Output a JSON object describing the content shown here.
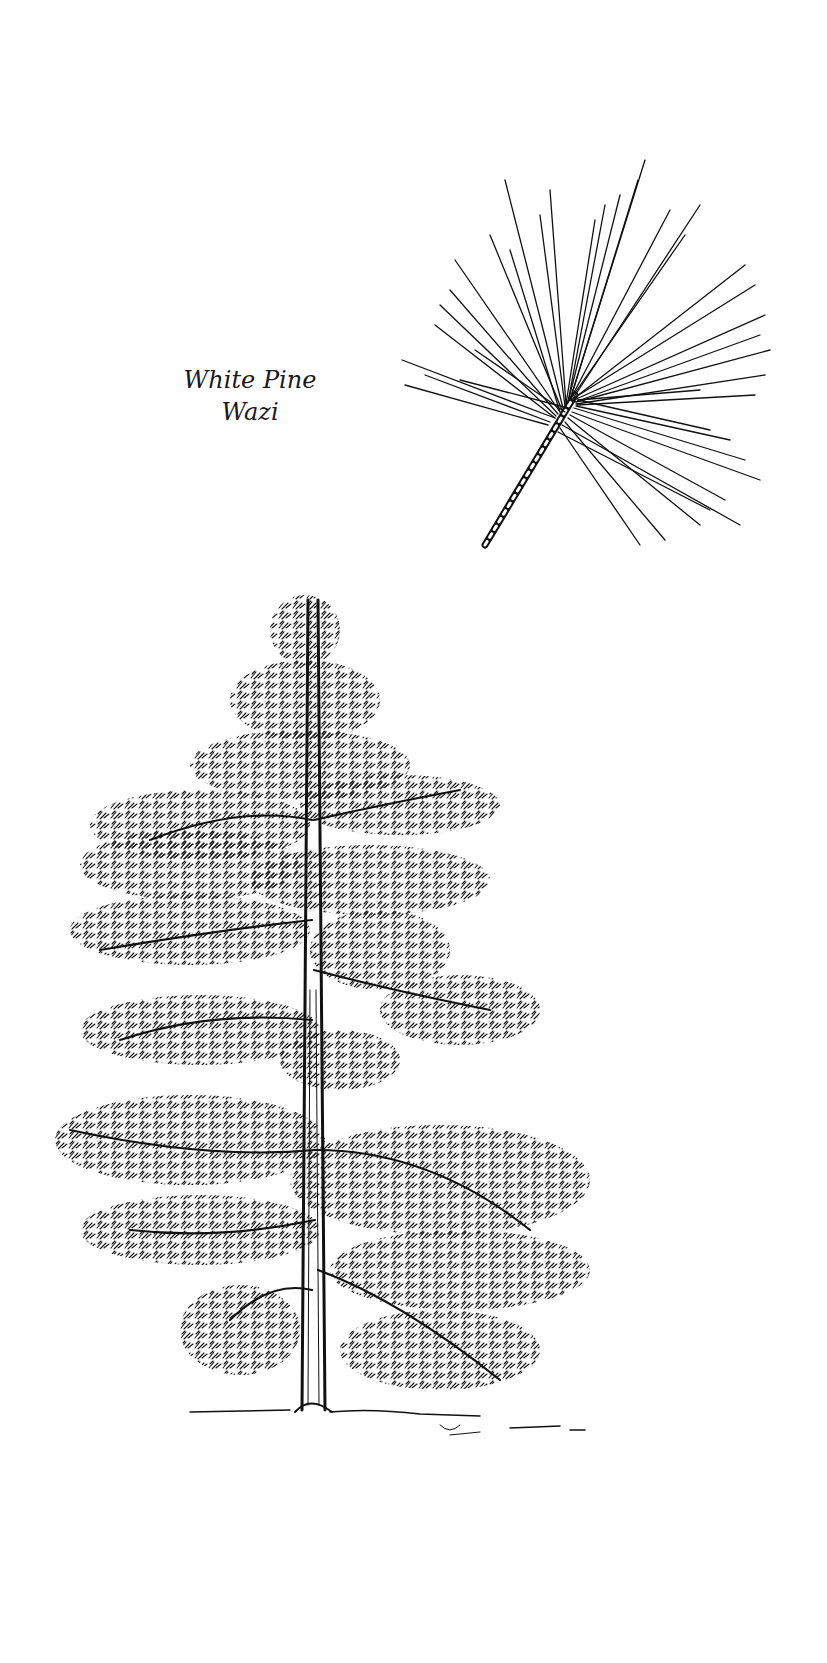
{
  "caption": {
    "common_name": "White Pine",
    "native_name": "Wazi"
  },
  "illustrations": {
    "needle_cluster": {
      "icon": "pine-needle-sprig-icon",
      "ink_color": "#111111"
    },
    "tree": {
      "icon": "white-pine-tree-icon",
      "ink_color": "#111111"
    }
  }
}
